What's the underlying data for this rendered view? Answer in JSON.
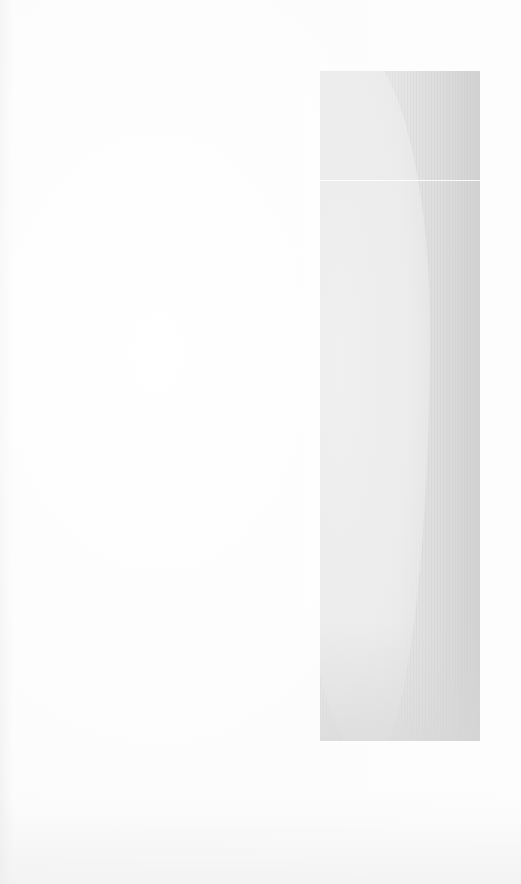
{
  "page": {
    "background_color": "#fbfbfb",
    "has_text": false
  },
  "figure": {
    "kind": "grayscale-image-block",
    "fill_color": "#e2e2e2",
    "shadow_color": "#d5d5d5",
    "highlight_color": "#efefef"
  }
}
